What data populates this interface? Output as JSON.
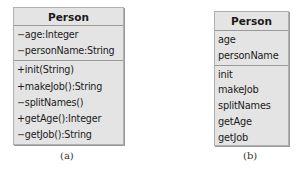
{
  "diagrams": [
    {
      "caption": "(a)",
      "class_name": "Person",
      "attributes": [
        "−age:Integer",
        "−personName:String"
      ],
      "operations": [
        "+init(String)",
        "+makeJob():String",
        "−splitNames()",
        "+getAge():Integer",
        "−getJob():String"
      ]
    },
    {
      "caption": "(b)",
      "class_name": "Person",
      "attributes": [
        "age",
        "personName"
      ],
      "operations": [
        "init",
        "makeJob",
        "splitNames",
        "getAge",
        "getJob"
      ]
    }
  ],
  "colors": {
    "box_fill": "#e4e4e4",
    "divider": "#9a9a9a"
  }
}
